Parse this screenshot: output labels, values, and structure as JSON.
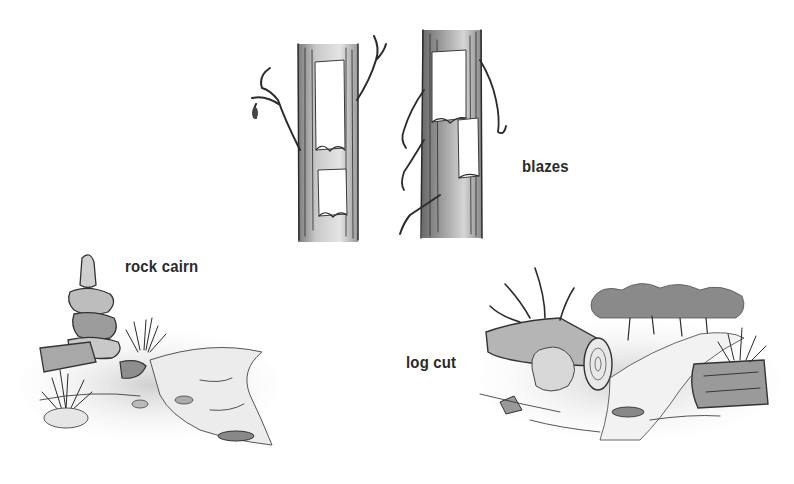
{
  "illustration": {
    "style": "black-and-white pen-and-ink sketch",
    "background": "#ffffff",
    "ink_color": "#2b2b2b"
  },
  "labels": {
    "blazes": "blazes",
    "rock_cairn": "rock cairn",
    "log_cut": "log cut"
  },
  "scenes": [
    {
      "id": "blazes",
      "description": "two tree trunks with rectangular paint blazes cut into the bark"
    },
    {
      "id": "rock_cairn",
      "description": "stacked rocks beside a trail with grass tufts"
    },
    {
      "id": "log_cut",
      "description": "fallen tree with sawn log end across a trail, forest in background"
    }
  ]
}
